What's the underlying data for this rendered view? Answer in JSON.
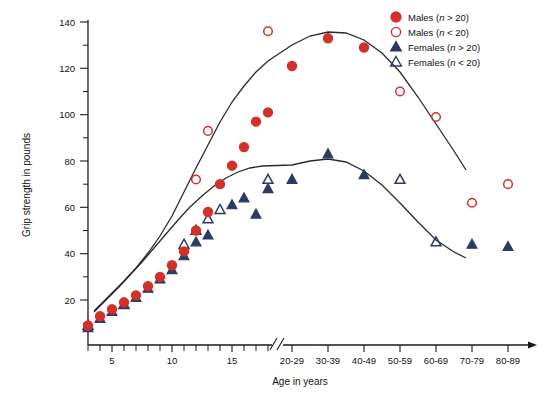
{
  "chart_data": {
    "type": "scatter",
    "title": "",
    "xlabel": "Age in years",
    "ylabel": "Grip strength in pounds",
    "ylim": [
      0,
      140
    ],
    "yticks": [
      20,
      40,
      60,
      80,
      100,
      120,
      140
    ],
    "y_minor_step": 10,
    "grid": false,
    "axis_break": true,
    "axis_break_note": "// break between individual years (2-18) and decade bins (20-29 …)",
    "x_young_ticks": [
      5,
      10,
      15
    ],
    "x_young_range": [
      3,
      19
    ],
    "x_decade_categories": [
      "20-29",
      "30-39",
      "40-49",
      "50-59",
      "60-69",
      "70-79",
      "80-89"
    ],
    "legend_position": "top-right",
    "legend": [
      {
        "label": "Males (n > 20)",
        "marker": "filled-circle",
        "color": "#D4302A"
      },
      {
        "label": "Males (n < 20)",
        "marker": "open-circle",
        "color": "#D4302A"
      },
      {
        "label": "Females (n > 20)",
        "marker": "filled-triangle",
        "color": "#2D3A64"
      },
      {
        "label": "Females (n < 20)",
        "marker": "open-triangle",
        "color": "#2D3A64"
      }
    ],
    "series": [
      {
        "name": "Males (n > 20)",
        "marker": "filled-circle",
        "color": "#D4302A",
        "points": [
          {
            "x": 3,
            "y": 9
          },
          {
            "x": 4,
            "y": 13
          },
          {
            "x": 5,
            "y": 16
          },
          {
            "x": 6,
            "y": 19
          },
          {
            "x": 7,
            "y": 22
          },
          {
            "x": 8,
            "y": 26
          },
          {
            "x": 9,
            "y": 30
          },
          {
            "x": 10,
            "y": 35
          },
          {
            "x": 11,
            "y": 41
          },
          {
            "x": 12,
            "y": 50
          },
          {
            "x": 13,
            "y": 58
          },
          {
            "x": 14,
            "y": 70
          },
          {
            "x": 15,
            "y": 78
          },
          {
            "x": 16,
            "y": 86
          },
          {
            "x": 17,
            "y": 97
          },
          {
            "x": 18,
            "y": 101
          },
          {
            "x": "20-29",
            "y": 121
          },
          {
            "x": "30-39",
            "y": 133
          },
          {
            "x": "40-49",
            "y": 129
          }
        ]
      },
      {
        "name": "Males (n < 20)",
        "marker": "open-circle",
        "color": "#D4302A",
        "points": [
          {
            "x": 12,
            "y": 72
          },
          {
            "x": 13,
            "y": 93
          },
          {
            "x": 18,
            "y": 136
          },
          {
            "x": "50-59",
            "y": 110
          },
          {
            "x": "60-69",
            "y": 99
          },
          {
            "x": "70-79",
            "y": 62
          },
          {
            "x": "80-89",
            "y": 70
          }
        ]
      },
      {
        "name": "Females (n > 20)",
        "marker": "filled-triangle",
        "color": "#2D3A64",
        "points": [
          {
            "x": 3,
            "y": 8
          },
          {
            "x": 4,
            "y": 12
          },
          {
            "x": 5,
            "y": 15
          },
          {
            "x": 6,
            "y": 18
          },
          {
            "x": 7,
            "y": 21
          },
          {
            "x": 8,
            "y": 25
          },
          {
            "x": 9,
            "y": 29
          },
          {
            "x": 10,
            "y": 33
          },
          {
            "x": 11,
            "y": 39
          },
          {
            "x": 12,
            "y": 45
          },
          {
            "x": 13,
            "y": 48
          },
          {
            "x": 15,
            "y": 61
          },
          {
            "x": 16,
            "y": 64
          },
          {
            "x": 17,
            "y": 57
          },
          {
            "x": 18,
            "y": 68
          },
          {
            "x": "20-29",
            "y": 72
          },
          {
            "x": "30-39",
            "y": 83
          },
          {
            "x": "40-49",
            "y": 74
          },
          {
            "x": "70-79",
            "y": 44
          },
          {
            "x": "80-89",
            "y": 43
          }
        ]
      },
      {
        "name": "Females (n < 20)",
        "marker": "open-triangle",
        "color": "#2D3A64",
        "points": [
          {
            "x": 3,
            "y": 9
          },
          {
            "x": 6,
            "y": 18
          },
          {
            "x": 11,
            "y": 44
          },
          {
            "x": 12,
            "y": 50
          },
          {
            "x": 13,
            "y": 55
          },
          {
            "x": 14,
            "y": 59
          },
          {
            "x": 18,
            "y": 72
          },
          {
            "x": "50-59",
            "y": 72
          },
          {
            "x": "60-69",
            "y": 45
          }
        ]
      }
    ],
    "fit_curves": [
      {
        "name": "Males fitted curve",
        "color": "#2b2b2b",
        "path": "M 94,311 L 100,305 L 112,293 L 124,281 L 136,268 L 148,253 L 160,236 L 172,216 L 184,192 L 196,168 L 208,145 L 220,122 L 232,102 L 244,86 L 256,72 L 268,61 L 292,45 L 310,36 L 328,32 L 346,33 L 364,40 L 382,53 L 400,72 L 418,97 L 436,124 L 454,151 L 466,170"
      },
      {
        "name": "Females fitted curve",
        "color": "#2b2b2b",
        "path": "M 94,312 L 106,300 L 118,288 L 130,275 L 142,262 L 154,248 L 166,234 L 178,220 L 190,207 L 202,196 L 214,186 L 226,178 L 238,172 L 250,168 L 262,166 L 292,165 L 310,161 L 328,159 L 346,162 L 364,171 L 382,185 L 400,203 L 418,222 L 436,240 L 454,252 L 466,258"
      }
    ]
  }
}
